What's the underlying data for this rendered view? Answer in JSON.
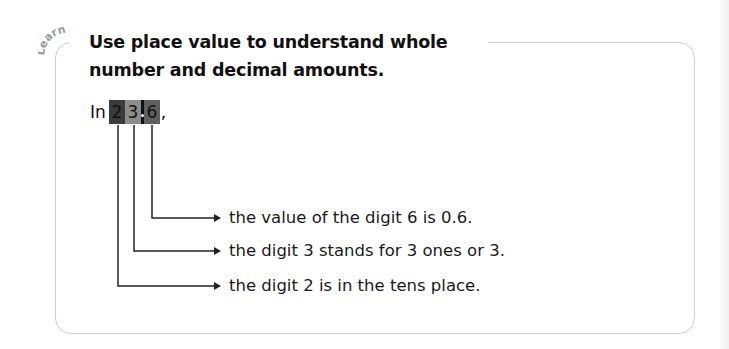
{
  "section_label": "Learn",
  "title": "Use place value to understand whole number and decimal amounts.",
  "example": {
    "intro": "In",
    "digits": [
      "2",
      "3",
      "6"
    ],
    "decimal_point": ".",
    "trailing": ","
  },
  "statements": [
    "the value of the digit 6 is 0.6.",
    "the digit 3 stands for 3 ones or 3.",
    "the digit 2 is in the tens place."
  ],
  "colors": {
    "digit_tens_bg": "#3b3b3b",
    "digit_ones_bg": "#8c8c8c",
    "digit_tenths_bg": "#5f5f5f",
    "card_border": "#cfcfcf",
    "learn_label": "#9a9a9a"
  }
}
